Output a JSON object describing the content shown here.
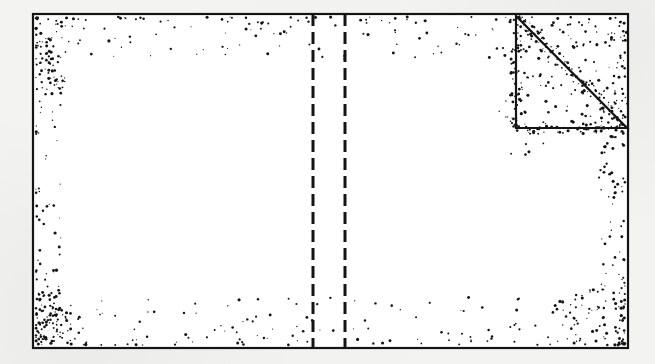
{
  "figure": {
    "caption": "",
    "background_color": "#f3f3f1",
    "ink_color": "#141414",
    "paper_color": "#ffffff"
  },
  "frame": {
    "name": "outer-rectangle",
    "x": 33,
    "y": 14,
    "width": 595,
    "height": 334,
    "stroke_width": 2.2,
    "fill": "#ffffff",
    "stroke": "#141414"
  },
  "dashed_lines": [
    {
      "name": "dashed-line-left",
      "x": 313,
      "y1": 14,
      "y2": 348,
      "stroke_width": 3.0,
      "dash": "12 6",
      "stroke": "#141414"
    },
    {
      "name": "dashed-line-right",
      "x": 345,
      "y1": 14,
      "y2": 348,
      "stroke_width": 3.0,
      "dash": "12 6",
      "stroke": "#141414"
    }
  ],
  "triangle": {
    "name": "corner-right-triangle",
    "apex_top": {
      "x": 516,
      "y": 16
    },
    "corner_bottom_left": {
      "x": 516,
      "y": 128
    },
    "vertex_right": {
      "x": 627,
      "y": 128
    },
    "stroke_width": 2.2,
    "stroke": "#141414",
    "fill": "none",
    "legs": [
      "vertical-left-leg",
      "horizontal-bottom-leg"
    ],
    "hypotenuse": "top-left-to-bottom-right"
  },
  "speckle": {
    "description": "Stipple / random dot noise concentrated in bands along the inner edges of the frame, along the triangle legs and hypotenuse; interior of the domain is blank.",
    "dot_color": "#141414",
    "dot_radius_min": 0.5,
    "dot_radius_max": 1.6,
    "bands": [
      {
        "name": "top-edge-band",
        "density": "high",
        "thickness": 42
      },
      {
        "name": "bottom-edge-band",
        "density": "high",
        "thickness": 48
      },
      {
        "name": "left-edge-band",
        "density": "medium",
        "thickness": 26
      },
      {
        "name": "right-edge-band",
        "density": "medium",
        "thickness": 26
      },
      {
        "name": "top-left-corner-cluster",
        "density": "very-high"
      },
      {
        "name": "bottom-left-corner-cluster",
        "density": "very-high"
      },
      {
        "name": "bottom-right-corner-cluster",
        "density": "high"
      },
      {
        "name": "triangle-hypotenuse-band",
        "density": "very-high"
      },
      {
        "name": "triangle-left-leg-band",
        "density": "high"
      },
      {
        "name": "triangle-bottom-leg-band",
        "density": "high"
      }
    ],
    "counts": {
      "top_edge": 150,
      "bottom_edge": 165,
      "left_edge": 95,
      "right_edge": 95,
      "triangle_region": 230
    }
  }
}
